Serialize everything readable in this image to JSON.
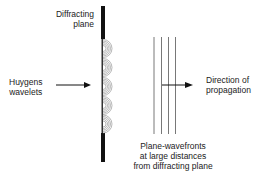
{
  "diagram": {
    "labels": {
      "diffracting_plane": [
        "Diffracting",
        "plane"
      ],
      "huygens_wavelets": [
        "Huygens",
        "wavelets"
      ],
      "direction": [
        "Direction of",
        "propagation"
      ],
      "plane_wavefronts": [
        "Plane-wavefronts",
        "at large distances",
        "from diffracting plane"
      ]
    },
    "elements": {
      "wavelet_count": 5,
      "wavefront_count": 4
    },
    "colors": {
      "ink": "#111111",
      "wavelet": "#888888",
      "wavefront": "#555555"
    }
  }
}
